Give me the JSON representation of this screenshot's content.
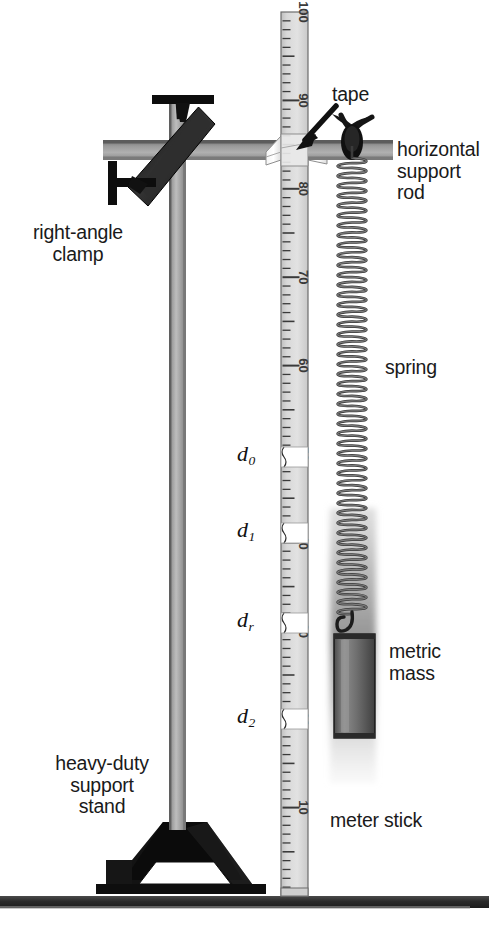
{
  "figure": {
    "background": "#ffffff",
    "width": 489,
    "height": 943
  },
  "labels": {
    "tape": "tape",
    "horizontal_support_rod": "horizontal\nsupport\nrod",
    "right_angle_clamp": "right-angle\nclamp",
    "spring": "spring",
    "metric_mass": "metric\nmass",
    "meter_stick": "meter stick",
    "heavy_duty_support_stand": "heavy-duty\nsupport\nstand"
  },
  "distance_markers": [
    {
      "name": "d0",
      "base": "d",
      "sub": "0",
      "y": 455
    },
    {
      "name": "d1",
      "base": "d",
      "sub": "1",
      "y": 531
    },
    {
      "name": "dr",
      "base": "d",
      "sub": "r",
      "y": 621
    },
    {
      "name": "d2",
      "base": "d",
      "sub": "2",
      "y": 717
    }
  ],
  "meter_stick": {
    "name": "meter-stick",
    "major_ticks": [
      "100",
      "90",
      "80",
      "70",
      "60",
      "50",
      "40",
      "30",
      "20",
      "10"
    ],
    "orientation": "vertical",
    "numbers_read_downward": true,
    "top_value": 100,
    "bottom_value": 0,
    "tape_band_count": 4,
    "face_color": "#d9d9d9",
    "tick_color": "#3a3a3a"
  },
  "colors": {
    "rod_gray": "#8f8f8f",
    "rod_dark": "#5a5a5a",
    "clamp_black": "#1c1c1c",
    "stand_black": "#111111",
    "table_gray": "#2b2b2b",
    "stick_face": "#d7d7d7",
    "spring_wire": "#3b3b3b",
    "mass_body": "#6e6e6e",
    "text": "#1a1a1a"
  },
  "components": {
    "vertical_rod": "vertical-support-rod",
    "horizontal_rod": "horizontal-support-rod",
    "clamp": "right-angle-clamp",
    "clamp_screw_top": "clamp-thumbscrew-top",
    "clamp_screw_left": "clamp-thumbscrew-left",
    "spring": "helical-spring",
    "mass": "metric-mass-cylinder",
    "mass_hook": "mass-hook",
    "tape_wrap_stick": "tape-wrap-on-meter-stick",
    "tape_wrap_spring": "tape-wrap-on-spring",
    "arrow": "tape-pointer-arrow",
    "base": "tripod-base",
    "table": "table-surface"
  }
}
